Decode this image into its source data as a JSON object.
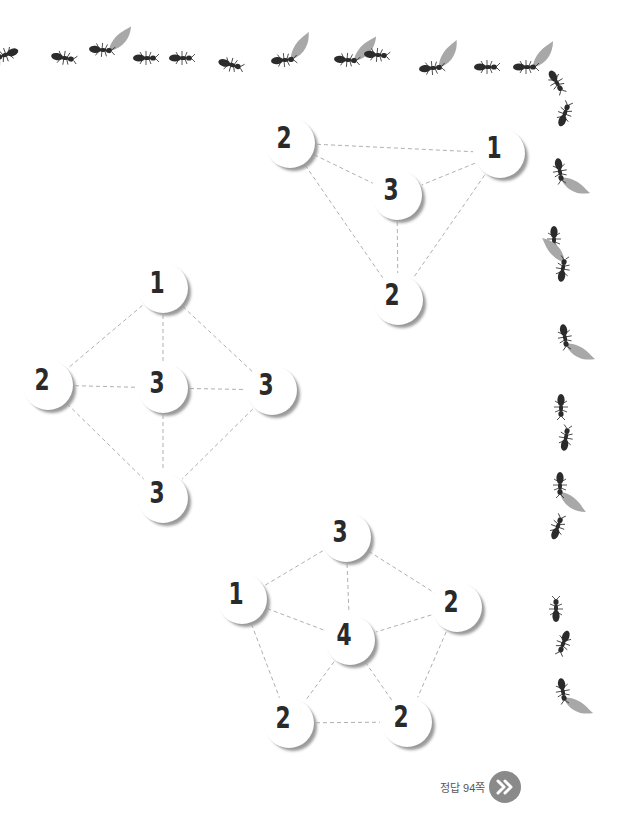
{
  "colors": {
    "ant": "#2b2b2b",
    "leaf": "#a8a8a8",
    "edge": "#b0b0b0",
    "node_shadow": "#9a9a9a",
    "button": "#8a8a8a"
  },
  "puzzles": [
    {
      "name": "triangle",
      "nodes": [
        {
          "id": "a",
          "value": "2",
          "x": 290,
          "y": 143
        },
        {
          "id": "b",
          "value": "1",
          "x": 500,
          "y": 153
        },
        {
          "id": "c",
          "value": "3",
          "x": 397,
          "y": 195
        },
        {
          "id": "d",
          "value": "2",
          "x": 398,
          "y": 300
        }
      ],
      "edges": [
        [
          "a",
          "b"
        ],
        [
          "a",
          "c"
        ],
        [
          "a",
          "d"
        ],
        [
          "b",
          "c"
        ],
        [
          "b",
          "d"
        ],
        [
          "c",
          "d"
        ]
      ]
    },
    {
      "name": "diamond",
      "nodes": [
        {
          "id": "a",
          "value": "1",
          "x": 163,
          "y": 288
        },
        {
          "id": "b",
          "value": "2",
          "x": 48,
          "y": 385
        },
        {
          "id": "c",
          "value": "3",
          "x": 163,
          "y": 388
        },
        {
          "id": "d",
          "value": "3",
          "x": 272,
          "y": 390
        },
        {
          "id": "e",
          "value": "3",
          "x": 163,
          "y": 498
        }
      ],
      "edges": [
        [
          "a",
          "b"
        ],
        [
          "a",
          "c"
        ],
        [
          "a",
          "d"
        ],
        [
          "b",
          "c"
        ],
        [
          "c",
          "d"
        ],
        [
          "b",
          "e"
        ],
        [
          "c",
          "e"
        ],
        [
          "d",
          "e"
        ]
      ]
    },
    {
      "name": "pentagon",
      "nodes": [
        {
          "id": "a",
          "value": "3",
          "x": 346,
          "y": 537
        },
        {
          "id": "b",
          "value": "1",
          "x": 242,
          "y": 599
        },
        {
          "id": "c",
          "value": "2",
          "x": 457,
          "y": 607
        },
        {
          "id": "d",
          "value": "4",
          "x": 350,
          "y": 640
        },
        {
          "id": "e",
          "value": "2",
          "x": 289,
          "y": 723
        },
        {
          "id": "f",
          "value": "2",
          "x": 407,
          "y": 722
        }
      ],
      "edges": [
        [
          "a",
          "b"
        ],
        [
          "a",
          "c"
        ],
        [
          "a",
          "d"
        ],
        [
          "b",
          "d"
        ],
        [
          "c",
          "d"
        ],
        [
          "b",
          "e"
        ],
        [
          "c",
          "f"
        ],
        [
          "d",
          "e"
        ],
        [
          "d",
          "f"
        ],
        [
          "e",
          "f"
        ]
      ]
    }
  ],
  "ants_top": [
    {
      "x": 5,
      "y": 55,
      "rot": 160,
      "leaf": true
    },
    {
      "x": 65,
      "y": 58,
      "rot": 10,
      "leaf": false
    },
    {
      "x": 103,
      "y": 50,
      "rot": 5,
      "leaf": true
    },
    {
      "x": 147,
      "y": 58,
      "rot": 0,
      "leaf": false
    },
    {
      "x": 183,
      "y": 58,
      "rot": 0,
      "leaf": false
    },
    {
      "x": 232,
      "y": 65,
      "rot": 15,
      "leaf": false
    },
    {
      "x": 285,
      "y": 60,
      "rot": -5,
      "leaf": true
    },
    {
      "x": 348,
      "y": 60,
      "rot": 5,
      "leaf": true
    },
    {
      "x": 378,
      "y": 55,
      "rot": 5,
      "leaf": false
    },
    {
      "x": 433,
      "y": 68,
      "rot": -5,
      "leaf": true
    },
    {
      "x": 488,
      "y": 67,
      "rot": 0,
      "leaf": false
    },
    {
      "x": 527,
      "y": 67,
      "rot": 0,
      "leaf": true
    }
  ],
  "ants_right": [
    {
      "x": 557,
      "y": 83,
      "rot": 60,
      "leaf": false
    },
    {
      "x": 565,
      "y": 113,
      "rot": -70,
      "leaf": false
    },
    {
      "x": 560,
      "y": 172,
      "rot": 80,
      "leaf": true
    },
    {
      "x": 554,
      "y": 240,
      "rot": 90,
      "leaf": false
    },
    {
      "x": 563,
      "y": 268,
      "rot": -80,
      "leaf": true
    },
    {
      "x": 565,
      "y": 338,
      "rot": 80,
      "leaf": true
    },
    {
      "x": 561,
      "y": 408,
      "rot": 90,
      "leaf": false
    },
    {
      "x": 566,
      "y": 437,
      "rot": -80,
      "leaf": false
    },
    {
      "x": 560,
      "y": 486,
      "rot": 90,
      "leaf": true
    },
    {
      "x": 558,
      "y": 526,
      "rot": -70,
      "leaf": false
    },
    {
      "x": 556,
      "y": 608,
      "rot": -90,
      "leaf": false
    },
    {
      "x": 563,
      "y": 644,
      "rot": 110,
      "leaf": false
    },
    {
      "x": 563,
      "y": 692,
      "rot": 80,
      "leaf": true
    }
  ],
  "answer": {
    "label": "정답 94쪽",
    "icon": "double-chevron-right-icon"
  }
}
